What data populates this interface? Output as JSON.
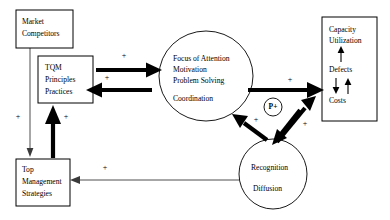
{
  "diagram": {
    "nodes": {
      "market_competitors": {
        "lines": [
          "Market",
          "Competitors"
        ]
      },
      "tqm": {
        "lines": [
          "TQM",
          "Principles",
          "Practices"
        ]
      },
      "top_management": {
        "lines": [
          "Top",
          "Management",
          "Strategies"
        ]
      },
      "focus": {
        "lines": [
          "Focus of Attention",
          "Motivation",
          "Problem Solving",
          "Coordination"
        ]
      },
      "recognition": {
        "lines": [
          "Recognition",
          "Diffusion"
        ]
      },
      "outcomes": {
        "lines": [
          "Capacity",
          "Utilization",
          "Defects",
          "Costs"
        ]
      },
      "p_node": {
        "label": "P+"
      }
    },
    "edge_labels": {
      "tqm_to_focus": "+",
      "focus_to_tqm": "+",
      "topmgmt_to_tqm": "+",
      "market_to_topmgmt": "+",
      "focus_to_costs": "+",
      "recognition_to_focus": "+",
      "recognition_to_costs": "+",
      "recognition_to_topmgmt": "+"
    },
    "colors": {
      "stroke": "#000000",
      "thin_stroke": "#3a3a3a",
      "background": "#ffffff"
    }
  }
}
